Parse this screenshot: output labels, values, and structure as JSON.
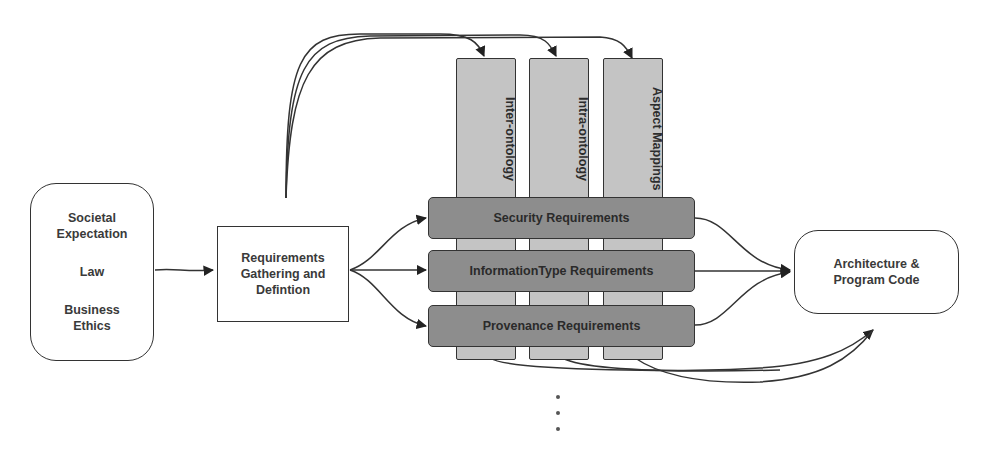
{
  "diagram": {
    "source_box": {
      "lines": [
        "Societal",
        "Expectation",
        "Law",
        "Business",
        "Ethics"
      ],
      "items": [
        "Societal Expectation",
        "Law",
        "Business Ethics"
      ]
    },
    "process_box": {
      "lines": [
        "Requirements",
        "Gathering and",
        "Defintion"
      ]
    },
    "columns": [
      {
        "label": "Inter-ontology"
      },
      {
        "label": "Intra-ontology"
      },
      {
        "label": "Aspect Mappings"
      }
    ],
    "bands": [
      {
        "label": "Security Requirements"
      },
      {
        "label": "InformationType Requirements"
      },
      {
        "label": "Provenance Requirements"
      }
    ],
    "target_box": {
      "lines": [
        "Architecture &",
        "Program Code"
      ]
    },
    "continuation": "⋮",
    "colors": {
      "column_fill": "#c4c4c4",
      "band_fill": "#8d8d8d",
      "stroke": "#333333"
    }
  }
}
